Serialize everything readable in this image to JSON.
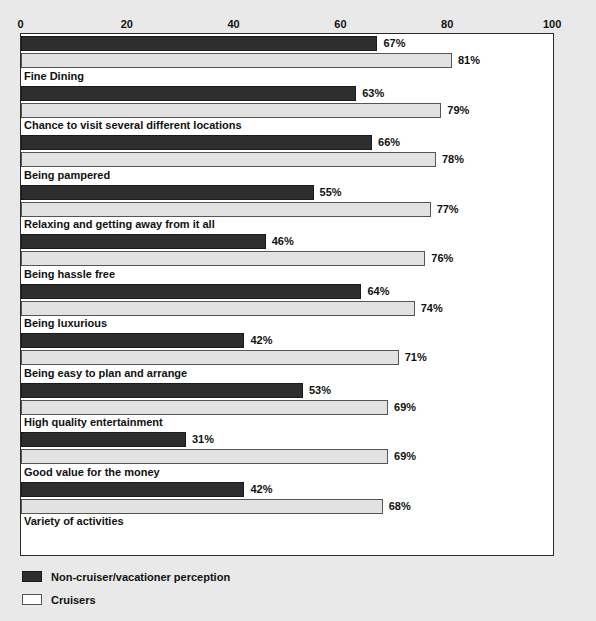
{
  "chart_data": {
    "type": "bar",
    "orientation": "horizontal",
    "title": "",
    "xlabel": "",
    "ylabel": "",
    "xlim": [
      0,
      100
    ],
    "xticks": [
      "0",
      "20",
      "40",
      "60",
      "80",
      "100"
    ],
    "grid": false,
    "legend_position": "bottom-left",
    "categories": [
      "Fine Dining",
      "Chance to visit several different locations",
      "Being pampered",
      "Relaxing and getting away from it all",
      "Being hassle free",
      "Being luxurious",
      "Being easy to plan and arrange",
      "High quality entertainment",
      "Good value for the money",
      "Variety of activities"
    ],
    "series": [
      {
        "name": "Non-cruiser/vacationer perception",
        "color": "#2e2e2e",
        "values": [
          67,
          63,
          66,
          55,
          46,
          64,
          42,
          53,
          31,
          42
        ],
        "labels": [
          "67%",
          "63%",
          "66%",
          "55%",
          "46%",
          "64%",
          "42%",
          "53%",
          "31%",
          "42%"
        ]
      },
      {
        "name": "Cruisers",
        "color": "#e2e2e2",
        "values": [
          81,
          79,
          78,
          77,
          76,
          74,
          71,
          69,
          69,
          68
        ],
        "labels": [
          "81%",
          "79%",
          "78%",
          "77%",
          "76%",
          "74%",
          "71%",
          "69%",
          "69%",
          "68%"
        ]
      }
    ]
  },
  "legend": {
    "items": [
      {
        "label": "Non-cruiser/vacationer perception",
        "swatch": "dark"
      },
      {
        "label": "Cruisers",
        "swatch": "light"
      }
    ]
  }
}
